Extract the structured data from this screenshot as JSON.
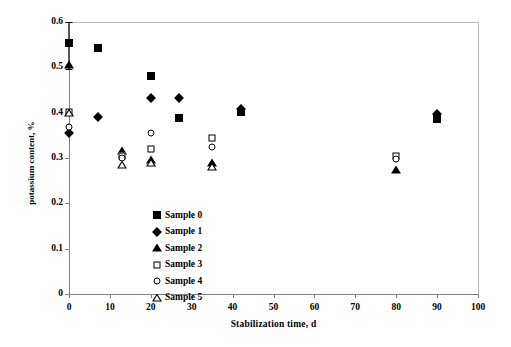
{
  "chart_data": {
    "type": "scatter",
    "title": "",
    "xlabel": "Stabilization time, d",
    "ylabel": "potassium content, %",
    "xlim": [
      0,
      100
    ],
    "ylim": [
      0,
      0.6
    ],
    "xticks": [
      "0",
      "10",
      "20",
      "30",
      "40",
      "50",
      "60",
      "70",
      "80",
      "90",
      "100"
    ],
    "xtick_values": [
      0,
      10,
      20,
      30,
      40,
      50,
      60,
      70,
      80,
      90,
      100
    ],
    "yticks": [
      "0",
      "0.1",
      "0.2",
      "0.3",
      "0.4",
      "0.5",
      "0.6"
    ],
    "ytick_values": [
      0,
      0.1,
      0.2,
      0.3,
      0.4,
      0.5,
      0.6
    ],
    "grid": false,
    "legend_position": "inside-lower-left",
    "series": [
      {
        "name": "Sample 0",
        "marker": "filled-square",
        "color": "#000000",
        "points": [
          {
            "x": 0,
            "y": 0.553,
            "yerr_low": 0.057,
            "yerr_high": 0.047
          },
          {
            "x": 7,
            "y": 0.543
          },
          {
            "x": 20,
            "y": 0.481
          },
          {
            "x": 27,
            "y": 0.389
          },
          {
            "x": 42,
            "y": 0.402
          },
          {
            "x": 90,
            "y": 0.386
          }
        ]
      },
      {
        "name": "Sample 1",
        "marker": "filled-diamond",
        "color": "#000000",
        "points": [
          {
            "x": 0,
            "y": 0.355
          },
          {
            "x": 7,
            "y": 0.391
          },
          {
            "x": 20,
            "y": 0.432
          },
          {
            "x": 27,
            "y": 0.432
          },
          {
            "x": 42,
            "y": 0.409
          },
          {
            "x": 90,
            "y": 0.396
          }
        ]
      },
      {
        "name": "Sample 2",
        "marker": "filled-triangle",
        "color": "#000000",
        "points": [
          {
            "x": 0,
            "y": 0.505
          },
          {
            "x": 13,
            "y": 0.315
          },
          {
            "x": 20,
            "y": 0.295
          },
          {
            "x": 35,
            "y": 0.29
          },
          {
            "x": 80,
            "y": 0.274
          }
        ]
      },
      {
        "name": "Sample 3",
        "marker": "open-square",
        "color": "#000000",
        "points": [
          {
            "x": 0,
            "y": 0.401
          },
          {
            "x": 13,
            "y": 0.305
          },
          {
            "x": 20,
            "y": 0.32
          },
          {
            "x": 35,
            "y": 0.345
          },
          {
            "x": 80,
            "y": 0.305
          }
        ]
      },
      {
        "name": "Sample 4",
        "marker": "open-circle",
        "color": "#000000",
        "points": [
          {
            "x": 0,
            "y": 0.368
          },
          {
            "x": 13,
            "y": 0.3
          },
          {
            "x": 20,
            "y": 0.355
          },
          {
            "x": 35,
            "y": 0.325
          },
          {
            "x": 80,
            "y": 0.298
          }
        ]
      },
      {
        "name": "Sample 5",
        "marker": "open-triangle",
        "color": "#000000",
        "points": [
          {
            "x": 0,
            "y": 0.4
          },
          {
            "x": 13,
            "y": 0.285
          },
          {
            "x": 20,
            "y": 0.289
          },
          {
            "x": 35,
            "y": 0.28
          }
        ]
      }
    ]
  }
}
